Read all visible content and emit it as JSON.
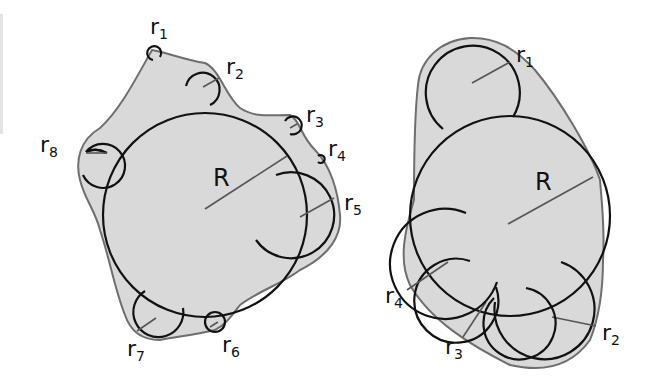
{
  "figure": {
    "left_panel": {
      "big_radius_label": "R",
      "small_radius_labels": [
        {
          "base": "r",
          "sub": "1"
        },
        {
          "base": "r",
          "sub": "2"
        },
        {
          "base": "r",
          "sub": "3"
        },
        {
          "base": "r",
          "sub": "4"
        },
        {
          "base": "r",
          "sub": "5"
        },
        {
          "base": "r",
          "sub": "6"
        },
        {
          "base": "r",
          "sub": "7"
        },
        {
          "base": "r",
          "sub": "8"
        }
      ]
    },
    "right_panel": {
      "big_radius_label": "R",
      "small_radius_labels": [
        {
          "base": "r",
          "sub": "1"
        },
        {
          "base": "r",
          "sub": "2"
        },
        {
          "base": "r",
          "sub": "3"
        },
        {
          "base": "r",
          "sub": "4"
        }
      ]
    },
    "colors": {
      "fill": "#d9d9d9",
      "outline": "#6e6e6e",
      "circle_stroke": "#111111",
      "background": "#ffffff"
    }
  }
}
